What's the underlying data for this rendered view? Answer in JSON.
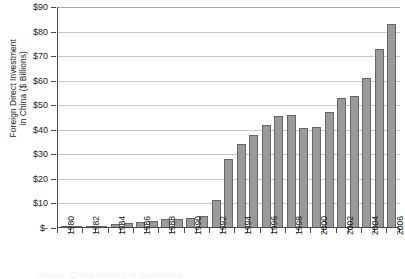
{
  "chart_data": {
    "type": "bar",
    "title": "",
    "xlabel": "",
    "ylabel": "Foreign Direct Investment in China ($ Billions)",
    "ylabel_line1": "Foreign Direct Investment",
    "ylabel_line2": "in China ($ Billions)",
    "ylim": [
      0,
      90
    ],
    "ytick_step": 10,
    "ytick_labels": [
      "$90",
      "$80",
      "$70",
      "$60",
      "$50",
      "$40",
      "$30",
      "$20",
      "$10",
      "$-"
    ],
    "ytick_values": [
      90,
      80,
      70,
      60,
      50,
      40,
      30,
      20,
      10,
      0
    ],
    "grid": true,
    "legend": "none",
    "categories": [
      "1980",
      "1981",
      "1982",
      "1983",
      "1984",
      "1985",
      "1986",
      "1987",
      "1988",
      "1989",
      "1990",
      "1991",
      "1992",
      "1993",
      "1994",
      "1995",
      "1996",
      "1997",
      "1998",
      "1999",
      "2000",
      "2001",
      "2002",
      "2003",
      "2004",
      "2005",
      "2006"
    ],
    "xtick_labels_shown": [
      "1980",
      "1982",
      "1984",
      "1986",
      "1988",
      "1990",
      "1992",
      "1994",
      "1996",
      "1998",
      "2000",
      "2002",
      "2004",
      "2006"
    ],
    "values": [
      0.1,
      0.3,
      0.4,
      0.6,
      1.3,
      1.7,
      1.9,
      2.3,
      3.2,
      3.4,
      3.5,
      4.4,
      11.0,
      27.5,
      33.8,
      37.5,
      41.7,
      45.3,
      45.5,
      40.3,
      40.7,
      46.9,
      52.7,
      53.5,
      60.6,
      72.4,
      82.7
    ],
    "bar_color": "#9a9a9a",
    "bar_border_color": "#666666",
    "gridline_color": "#c8c8c8",
    "axis_color": "#4a4a4a",
    "background": "#ffffff"
  },
  "caption": {
    "text": "Source: China Ministry of Commerce"
  }
}
